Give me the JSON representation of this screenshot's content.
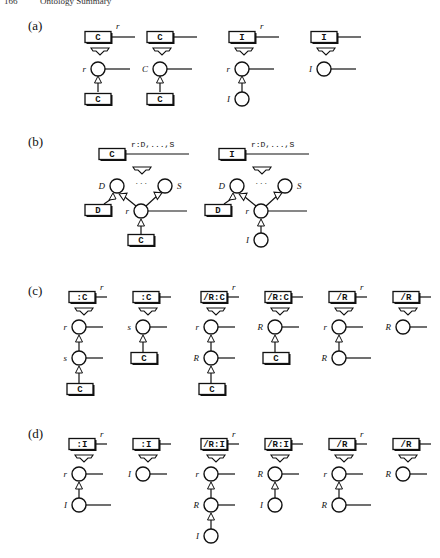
{
  "header": {
    "page_number": "166",
    "running_title": "Ontology Summary"
  },
  "panels": [
    {
      "label": "(a)",
      "items": [
        {
          "top_box": "C",
          "top_var": "r",
          "nodes": [
            {
              "label": "r",
              "tail": true
            },
            {
              "box": "C"
            }
          ]
        },
        {
          "top_box": "C",
          "top_var": "",
          "nodes": [
            {
              "label": "C",
              "tail": true
            },
            {
              "box": "C"
            }
          ]
        },
        {
          "top_box": "I",
          "top_var": "r",
          "nodes": [
            {
              "label": "r",
              "tail": true
            },
            {
              "label": "I",
              "tail": false
            }
          ]
        },
        {
          "top_box": "I",
          "top_var": "",
          "nodes": [
            {
              "label": "I",
              "tail": true
            }
          ]
        }
      ]
    },
    {
      "label": "(b)",
      "items": [
        {
          "top_box": "C",
          "top_var": "r:D,...,S",
          "left_node": "D",
          "right_node": "S",
          "dots": "· · ·",
          "center": "r",
          "side_box": "D",
          "bottom": {
            "box": "C"
          }
        },
        {
          "top_box": "I",
          "top_var": "r:D,...,S",
          "left_node": "D",
          "right_node": "S",
          "dots": "· · ·",
          "center": "r",
          "side_box": "D",
          "bottom": {
            "label": "I"
          }
        }
      ]
    },
    {
      "label": "(c)",
      "items": [
        {
          "top_box": ":C",
          "top_var": "r",
          "nodes": [
            {
              "label": "r",
              "tail": true
            },
            {
              "label": "s",
              "tail": true
            },
            {
              "box": "C"
            }
          ]
        },
        {
          "top_box": ":C",
          "top_var": "",
          "nodes": [
            {
              "label": "s",
              "tail": true
            },
            {
              "box": "C"
            }
          ]
        },
        {
          "top_box": "/R:C",
          "top_var": "r",
          "nodes": [
            {
              "label": "r",
              "tail": true
            },
            {
              "label": "R",
              "tail": true
            },
            {
              "box": "C"
            }
          ]
        },
        {
          "top_box": "/R:C",
          "top_var": "",
          "nodes": [
            {
              "label": "R",
              "tail": true
            },
            {
              "box": "C"
            }
          ]
        },
        {
          "top_box": "/R",
          "top_var": "r",
          "nodes": [
            {
              "label": "r",
              "tail": true
            },
            {
              "label": "R",
              "tail": true,
              "plain": true
            }
          ]
        },
        {
          "top_box": "/R",
          "top_var": "",
          "nodes": [
            {
              "label": "R",
              "tail": true
            }
          ]
        }
      ]
    },
    {
      "label": "(d)",
      "items": [
        {
          "top_box": ":I",
          "top_var": "r",
          "nodes": [
            {
              "label": "r",
              "tail": true
            },
            {
              "label": "I",
              "tail": true,
              "plain": true
            }
          ]
        },
        {
          "top_box": ":I",
          "top_var": "",
          "nodes": [
            {
              "label": "I",
              "tail": true
            }
          ]
        },
        {
          "top_box": "/R:I",
          "top_var": "r",
          "nodes": [
            {
              "label": "r",
              "tail": true
            },
            {
              "label": "R",
              "tail": true
            },
            {
              "label": "I",
              "tail": false
            }
          ]
        },
        {
          "top_box": "/R:I",
          "top_var": "",
          "nodes": [
            {
              "label": "R",
              "tail": true
            },
            {
              "label": "I",
              "tail": false
            }
          ]
        },
        {
          "top_box": "/R",
          "top_var": "r",
          "nodes": [
            {
              "label": "r",
              "tail": true
            },
            {
              "label": "R",
              "tail": true,
              "plain": true
            }
          ]
        },
        {
          "top_box": "/R",
          "top_var": "",
          "nodes": [
            {
              "label": "R",
              "tail": true
            }
          ]
        }
      ]
    }
  ]
}
